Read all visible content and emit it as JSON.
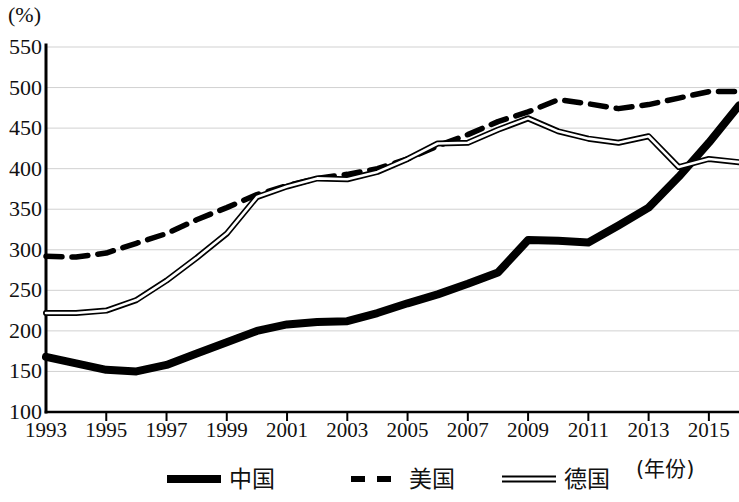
{
  "chart_data": {
    "type": "line",
    "title": "",
    "subtitle": "",
    "unit_label": "(%)",
    "xlabel": "(年份)",
    "ylabel": "(%)",
    "grid": true,
    "legend_position": "bottom",
    "xlim": [
      1993,
      2016
    ],
    "ylim": [
      100,
      550
    ],
    "ytick_step": 50,
    "yticks": [
      100,
      150,
      200,
      250,
      300,
      350,
      400,
      450,
      500,
      550
    ],
    "ytick_labels": [
      "100",
      "150",
      "200",
      "250",
      "300",
      "350",
      "400",
      "450",
      "500",
      "550"
    ],
    "xticks": [
      1993,
      1995,
      1997,
      1999,
      2001,
      2003,
      2005,
      2007,
      2009,
      2011,
      2013,
      2015
    ],
    "xtick_labels": [
      "1993",
      "1995",
      "1997",
      "1999",
      "2001",
      "2003",
      "2005",
      "2007",
      "2009",
      "2011",
      "2013",
      "2015"
    ],
    "x": [
      1993,
      1994,
      1995,
      1996,
      1997,
      1998,
      1999,
      2000,
      2001,
      2002,
      2003,
      2004,
      2005,
      2006,
      2007,
      2008,
      2009,
      2010,
      2011,
      2012,
      2013,
      2014,
      2015,
      2016
    ],
    "series": [
      {
        "name": "中国",
        "style": "solid-thick",
        "color": "#000000",
        "values": [
          168,
          160,
          152,
          150,
          158,
          172,
          186,
          200,
          208,
          211,
          212,
          222,
          234,
          245,
          258,
          272,
          312,
          311,
          309,
          330,
          352,
          390,
          432,
          478
        ]
      },
      {
        "name": "美国",
        "style": "dashed",
        "color": "#000000",
        "values": [
          292,
          291,
          296,
          308,
          320,
          337,
          352,
          368,
          379,
          388,
          393,
          400,
          412,
          428,
          442,
          458,
          470,
          485,
          480,
          474,
          479,
          487,
          495,
          495
        ]
      },
      {
        "name": "德国",
        "style": "double-hollow",
        "color": "#000000",
        "values": [
          222,
          222,
          225,
          238,
          262,
          290,
          320,
          365,
          378,
          388,
          387,
          396,
          412,
          431,
          432,
          448,
          462,
          446,
          437,
          432,
          440,
          402,
          412,
          408
        ]
      }
    ]
  },
  "axis": {
    "unit": "(%)",
    "x_caption": "(年份)"
  },
  "legend": {
    "items": [
      {
        "label": "中国",
        "style": "solid-thick"
      },
      {
        "label": "美国",
        "style": "dashed"
      },
      {
        "label": "德国",
        "style": "double-hollow"
      }
    ]
  }
}
